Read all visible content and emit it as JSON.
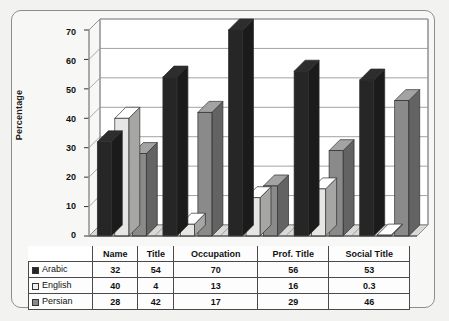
{
  "chart_data": {
    "type": "bar",
    "title": "",
    "subtitle": "",
    "xlabel": "",
    "ylabel": "Percentage",
    "ylim": [
      0,
      70
    ],
    "ytick_step": 10,
    "yticks": [
      0,
      10,
      20,
      30,
      40,
      50,
      60,
      70
    ],
    "grid": true,
    "grid_axis": "y",
    "three_d": true,
    "legend_position": "table-left",
    "categories": [
      "Name",
      "Title",
      "Occupation",
      "Prof. Title",
      "Social Title"
    ],
    "series": [
      {
        "name": "Arabic",
        "values": [
          32,
          54,
          70,
          56,
          53
        ],
        "color": "#262626",
        "swatch": "filled-dark-square"
      },
      {
        "name": "English",
        "values": [
          40,
          4,
          13,
          16,
          0.3
        ],
        "color": "#e6e6e4",
        "swatch": "empty-light-square"
      },
      {
        "name": "Persian",
        "values": [
          28,
          42,
          17,
          29,
          46
        ],
        "color": "#8a8a8a",
        "swatch": "filled-gray-square"
      }
    ],
    "data_table": {
      "row_header_blank": "",
      "column_headers": [
        "Name",
        "Title",
        "Occupation",
        "Prof. Title",
        "Social Title"
      ],
      "rows": [
        {
          "label": "Arabic",
          "cells": [
            "32",
            "54",
            "70",
            "56",
            "53"
          ]
        },
        {
          "label": "English",
          "cells": [
            "40",
            "4",
            "13",
            "16",
            "0.3"
          ]
        },
        {
          "label": "Persian",
          "cells": [
            "28",
            "42",
            "17",
            "29",
            "46"
          ]
        }
      ]
    }
  },
  "colors": {
    "arabic": "#262626",
    "english": "#e6e6e4",
    "persian": "#8a8a8a",
    "grid": "#9a9a9a",
    "frame": "#8d8d8d",
    "page_background": "#f2f2f0"
  }
}
